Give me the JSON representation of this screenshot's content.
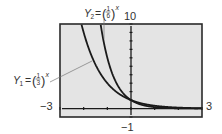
{
  "chart_data": {
    "type": "line",
    "title": "",
    "xlabel": "",
    "ylabel": "",
    "xlim": [
      -3,
      3
    ],
    "ylim": [
      -1,
      10
    ],
    "grid": false,
    "legend": "none",
    "window_labels": {
      "xmin": "−3",
      "xmax": "3",
      "ymin": "−1",
      "ymax": "10"
    },
    "x_ticks_every": 1,
    "y_ticks_every": 1,
    "series": [
      {
        "name": "Y1",
        "expression": "(1/3)^x",
        "base": 0.3333333,
        "label": {
          "var": "Y",
          "sub": "1",
          "num": "1",
          "den": "3",
          "exp": "x"
        },
        "x": [
          -2.1,
          -2.0,
          -1.5,
          -1.0,
          -0.5,
          0.0,
          0.5,
          1.0,
          1.5,
          2.0,
          2.5,
          3.0
        ],
        "values": [
          10.05,
          9.0,
          5.2,
          3.0,
          1.73,
          1.0,
          0.58,
          0.33,
          0.19,
          0.11,
          0.06,
          0.04
        ]
      },
      {
        "name": "Y2",
        "expression": "(1/6)^x",
        "base": 0.1666667,
        "label": {
          "var": "Y",
          "sub": "2",
          "num": "1",
          "den": "6",
          "exp": "x"
        },
        "x": [
          -1.29,
          -1.0,
          -0.5,
          0.0,
          0.5,
          1.0,
          1.5,
          2.0,
          2.5,
          3.0
        ],
        "values": [
          10.1,
          6.0,
          2.45,
          1.0,
          0.41,
          0.17,
          0.07,
          0.03,
          0.01,
          0.005
        ]
      }
    ],
    "annotations": [
      {
        "text": "Y1 = (1/3)^x",
        "points_to": "Y1 curve near x=-1.6"
      },
      {
        "text": "Y2 = (1/6)^x",
        "points_to": "Y2 curve near top"
      }
    ]
  },
  "colors": {
    "plot_background": "#e4e4e4",
    "frame": "#2a2a2a",
    "curve": "#1a1a1a",
    "axis": "#1a1a1a",
    "text": "#333333",
    "pointer": "#777777"
  }
}
